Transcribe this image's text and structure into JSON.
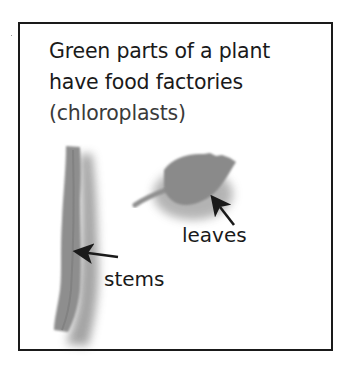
{
  "diagram": {
    "title_line1": "Green parts of a plant",
    "title_line2": "have food factories",
    "title_line3": "(chloroplasts)",
    "labels": {
      "leaves": "leaves",
      "stems": "stems"
    },
    "icons": {
      "stem": "plant-stem-illustration",
      "leaf": "plant-leaf-illustration",
      "arrow_leaves": "arrow-icon",
      "arrow_stems": "arrow-icon"
    },
    "colors": {
      "text": "#1a1a1a",
      "border": "#1a1a1a",
      "plant_gray": "#8c8c8c",
      "shadow_gray": "#6e6e6e"
    }
  }
}
